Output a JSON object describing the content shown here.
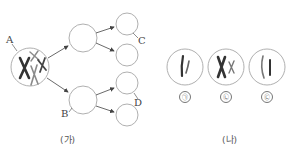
{
  "figure": {
    "part_a": {
      "caption": "(가)",
      "labels": {
        "A": "A",
        "B": "B",
        "C": "C",
        "D": "D"
      },
      "cells": {
        "mother": {
          "cx": 30,
          "cy": 67,
          "r": 19,
          "content": "chromosomes-mixed"
        },
        "middle": [
          {
            "cx": 83,
            "cy": 38,
            "r": 14
          },
          {
            "cx": 83,
            "cy": 100,
            "r": 14
          }
        ],
        "daughters": [
          {
            "cx": 127,
            "cy": 24,
            "r": 11
          },
          {
            "cx": 127,
            "cy": 55,
            "r": 11
          },
          {
            "cx": 127,
            "cy": 83,
            "r": 11
          },
          {
            "cx": 127,
            "cy": 115,
            "r": 11
          }
        ]
      }
    },
    "part_b": {
      "caption": "(나)",
      "cells": [
        {
          "label": "㉠",
          "content": "two-single-chromatid-chromosomes"
        },
        {
          "label": "㉡",
          "content": "duplicated-X-and-small-duplicated"
        },
        {
          "label": "㉢",
          "content": "two-single-chromatid-chromosomes"
        }
      ]
    },
    "colors": {
      "outline": "#b0b0b0",
      "chromosome_dark": "#333333",
      "chromosome_light": "#8a8a8a",
      "arrow": "#444444"
    }
  }
}
